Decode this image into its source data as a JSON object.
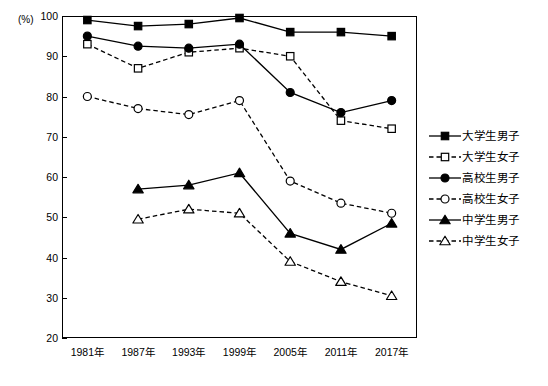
{
  "chart_data": {
    "type": "line",
    "title": "",
    "subtitle": "",
    "unit_label": "(%)",
    "xlabel": "",
    "ylabel": "",
    "categories": [
      "1981年",
      "1987年",
      "1993年",
      "1999年",
      "2005年",
      "2011年",
      "2017年"
    ],
    "ylim": [
      20,
      100
    ],
    "yticks": [
      20,
      30,
      40,
      50,
      60,
      70,
      80,
      90,
      100
    ],
    "ytick_labels": [
      "20",
      "30",
      "40",
      "50",
      "60",
      "70",
      "80",
      "90",
      "100"
    ],
    "grid": false,
    "legend_position": "right",
    "series": [
      {
        "name": "大学生男子",
        "marker": "filled-square",
        "line": "solid",
        "color": "#000000",
        "values": [
          99,
          97.5,
          98,
          99.5,
          96,
          96,
          95
        ]
      },
      {
        "name": "大学生女子",
        "marker": "open-square",
        "line": "dashed",
        "color": "#000000",
        "values": [
          93,
          87,
          91,
          92,
          90,
          74,
          72
        ]
      },
      {
        "name": "高校生男子",
        "marker": "filled-circle",
        "line": "solid",
        "color": "#000000",
        "values": [
          95,
          92.5,
          92,
          93,
          81,
          76,
          79
        ]
      },
      {
        "name": "高校生女子",
        "marker": "open-circle",
        "line": "dashed",
        "color": "#000000",
        "values": [
          80,
          77,
          75.5,
          79,
          59,
          53.5,
          51
        ]
      },
      {
        "name": "中学生男子",
        "marker": "filled-triangle",
        "line": "solid",
        "color": "#000000",
        "values": [
          null,
          57,
          58,
          61,
          46,
          42,
          48.5
        ]
      },
      {
        "name": "中学生女子",
        "marker": "open-triangle",
        "line": "dashed",
        "color": "#000000",
        "values": [
          null,
          49.5,
          52,
          51,
          39,
          34,
          30.5
        ]
      }
    ]
  }
}
